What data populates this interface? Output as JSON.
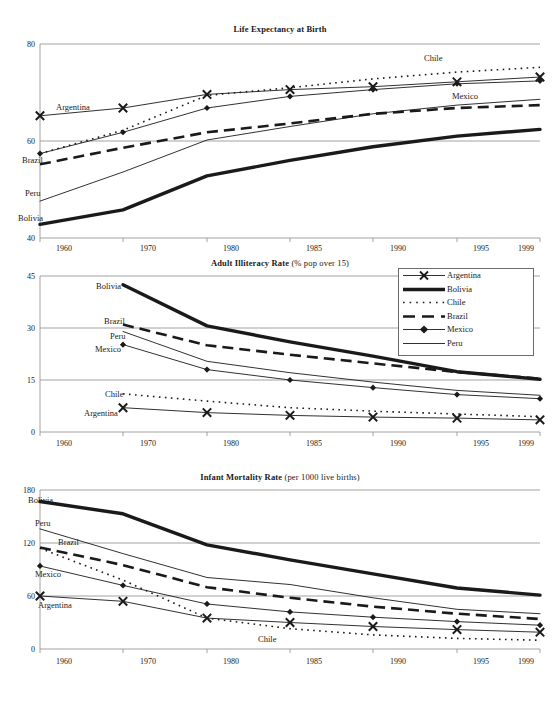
{
  "figure": {
    "width": 560,
    "height": 706,
    "background": "#ffffff",
    "ink": "#1a1a1a",
    "grid_color": "#8c8c8c"
  },
  "legend": {
    "position": "top-right of middle panel",
    "entries": [
      {
        "label": "Argentina",
        "style": "thin-solid-with-x-markers",
        "marker": "x"
      },
      {
        "label": "Bolivia",
        "style": "thick-solid",
        "marker": "none"
      },
      {
        "label": "Chile",
        "style": "dotted",
        "marker": "none"
      },
      {
        "label": "Brazil",
        "style": "dashed",
        "marker": "none"
      },
      {
        "label": "Mexico",
        "style": "thin-solid-with-diamond-markers",
        "marker": "diamond"
      },
      {
        "label": "Peru",
        "style": "thin-solid",
        "marker": "none"
      }
    ]
  },
  "chart_data": [
    {
      "type": "line",
      "title": "Life Expectancy at Birth",
      "title_main": "Life Expectancy at Birth",
      "title_sub": "",
      "xlabel": "",
      "ylabel": "",
      "x": [
        1960,
        1970,
        1980,
        1985,
        1990,
        1995,
        1999
      ],
      "xtick_labels": [
        "1960",
        "1970",
        "1980",
        "1985",
        "1990",
        "1995",
        "1999"
      ],
      "ylim": [
        40,
        80
      ],
      "yticks": [
        40,
        60,
        80
      ],
      "ytick_labels": [
        "40",
        "60",
        "80"
      ],
      "grid": true,
      "series": [
        {
          "name": "Argentina",
          "values": [
            65.2,
            66.8,
            69.6,
            70.6,
            71.2,
            72.2,
            73.2
          ],
          "label_anchor": {
            "x": 1960,
            "y": 67.6
          }
        },
        {
          "name": "Bolivia",
          "values": [
            42.8,
            45.8,
            52.8,
            56.0,
            58.8,
            61.0,
            62.4
          ],
          "label_anchor": {
            "x": 1960,
            "y": 42.0
          }
        },
        {
          "name": "Chile",
          "values": [
            57.4,
            62.2,
            69.4,
            71.0,
            72.8,
            74.2,
            75.2
          ],
          "label_anchor": {
            "x": 1994,
            "y": 76.6
          }
        },
        {
          "name": "Brazil",
          "values": [
            55.2,
            58.6,
            61.8,
            63.6,
            65.6,
            66.8,
            67.4
          ],
          "label_anchor": {
            "x": 1960,
            "y": 54.2
          }
        },
        {
          "name": "Mexico",
          "values": [
            57.4,
            61.8,
            66.8,
            69.2,
            70.6,
            71.8,
            72.4
          ],
          "label_anchor": {
            "x": 1992,
            "y": 68.6
          }
        },
        {
          "name": "Peru",
          "values": [
            47.6,
            53.6,
            60.2,
            63.0,
            65.6,
            67.4,
            68.6
          ],
          "label_anchor": {
            "x": 1960,
            "y": 48.4
          }
        }
      ],
      "inline_labels": [
        "Argentina",
        "Chile",
        "Mexico",
        "Brazil",
        "Peru",
        "Bolivia"
      ]
    },
    {
      "type": "line",
      "title": "Adult Illiteracy Rate (% pop over 15)",
      "title_main": "Adult Illiteracy Rate",
      "title_sub": "(% pop over 15)",
      "xlabel": "",
      "ylabel": "",
      "x": [
        1970,
        1980,
        1985,
        1990,
        1995,
        1999
      ],
      "xtick_labels": [
        "1960",
        "1970",
        "1980",
        "1985",
        "1990",
        "1995",
        "1999"
      ],
      "ylim": [
        0,
        45
      ],
      "yticks": [
        0,
        15,
        30,
        45
      ],
      "ytick_labels": [
        "0",
        "15",
        "30",
        "45"
      ],
      "grid": true,
      "series": [
        {
          "name": "Argentina",
          "values": [
            7.0,
            5.6,
            4.8,
            4.3,
            4.0,
            3.5
          ],
          "label_anchor": {
            "x": 1970,
            "y": 7.0
          }
        },
        {
          "name": "Bolivia",
          "values": [
            42.5,
            30.6,
            26.0,
            21.9,
            17.4,
            15.2
          ],
          "label_anchor": {
            "x": 1970,
            "y": 42.5
          }
        },
        {
          "name": "Chile",
          "values": [
            11.0,
            8.9,
            7.0,
            6.0,
            5.2,
            4.4
          ],
          "label_anchor": {
            "x": 1970,
            "y": 11.0
          }
        },
        {
          "name": "Brazil",
          "values": [
            31.0,
            25.0,
            22.3,
            19.8,
            17.3,
            15.4
          ],
          "label_anchor": {
            "x": 1970,
            "y": 31.0
          }
        },
        {
          "name": "Mexico",
          "values": [
            25.2,
            18.0,
            15.0,
            12.8,
            10.8,
            9.6
          ],
          "label_anchor": {
            "x": 1970,
            "y": 25.2
          }
        },
        {
          "name": "Peru",
          "values": [
            29.0,
            20.4,
            17.1,
            14.4,
            12.0,
            10.6
          ],
          "label_anchor": {
            "x": 1970,
            "y": 29.0
          }
        }
      ],
      "inline_labels": [
        "Bolivia",
        "Brazil",
        "Peru",
        "Mexico",
        "Chile",
        "Argentina"
      ]
    },
    {
      "type": "line",
      "title": "Infant Mortality Rate (per 1000 live births)",
      "title_main": "Infant Mortality Rate",
      "title_sub": "(per 1000 live births)",
      "xlabel": "",
      "ylabel": "",
      "x": [
        1960,
        1970,
        1980,
        1985,
        1990,
        1995,
        1999
      ],
      "xtick_labels": [
        "1960",
        "1970",
        "1980",
        "1985",
        "1990",
        "1995",
        "1999"
      ],
      "ylim": [
        0,
        180
      ],
      "yticks": [
        0,
        60,
        120,
        180
      ],
      "ytick_labels": [
        "0",
        "60",
        "120",
        "180"
      ],
      "grid": true,
      "series": [
        {
          "name": "Argentina",
          "values": [
            60.0,
            54.0,
            35.0,
            30.0,
            25.5,
            22.0,
            19.0
          ],
          "label_anchor": {
            "x": 1960,
            "y": 52.0
          }
        },
        {
          "name": "Bolivia",
          "values": [
            167.0,
            153.0,
            118.0,
            101.0,
            85.0,
            69.0,
            61.0
          ],
          "label_anchor": {
            "x": 1960,
            "y": 172.0
          }
        },
        {
          "name": "Chile",
          "values": [
            114.0,
            78.0,
            35.0,
            23.0,
            16.0,
            12.0,
            10.0
          ],
          "label_anchor": {
            "x": 1985,
            "y": 14.0
          }
        },
        {
          "name": "Brazil",
          "values": [
            115.0,
            95.0,
            70.0,
            58.0,
            48.0,
            40.0,
            34.0
          ],
          "label_anchor": {
            "x": 1960,
            "y": 118.0
          }
        },
        {
          "name": "Mexico",
          "values": [
            94.0,
            72.0,
            51.0,
            42.0,
            36.0,
            31.0,
            27.0
          ],
          "label_anchor": {
            "x": 1960,
            "y": 84.0
          }
        },
        {
          "name": "Peru",
          "values": [
            136.0,
            108.0,
            81.0,
            73.0,
            58.0,
            45.0,
            40.0
          ],
          "label_anchor": {
            "x": 1960,
            "y": 140.0
          }
        }
      ],
      "inline_labels": [
        "Bolivia",
        "Peru",
        "Brazil",
        "Mexico",
        "Argentina",
        "Chile"
      ]
    }
  ]
}
